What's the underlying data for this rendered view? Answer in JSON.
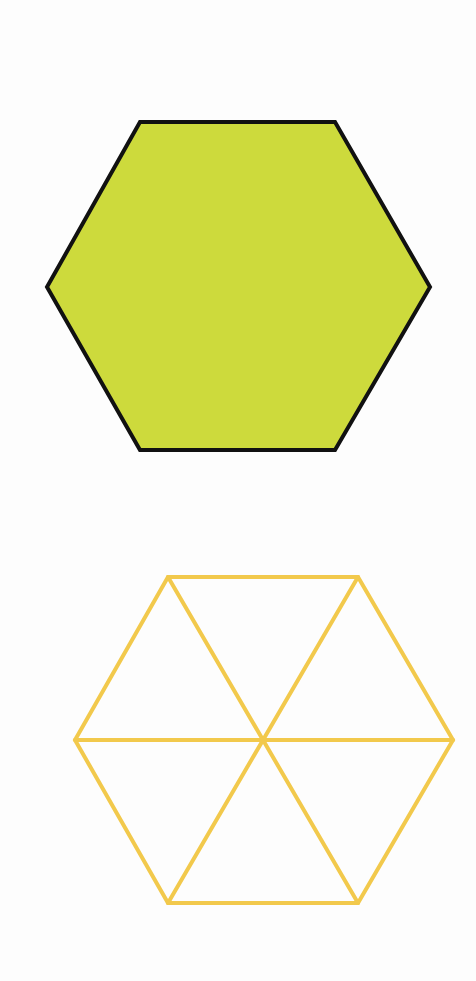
{
  "figures": {
    "filled_hexagon": {
      "points": [
        [
          140,
          122
        ],
        [
          335,
          122
        ],
        [
          430,
          287
        ],
        [
          335,
          450
        ],
        [
          140,
          450
        ],
        [
          47,
          287
        ]
      ],
      "fill": "#CDDA3C",
      "stroke": "#111111",
      "stroke_width": 4
    },
    "divided_hexagon": {
      "points": [
        [
          168,
          577
        ],
        [
          358,
          577
        ],
        [
          453,
          740
        ],
        [
          358,
          903
        ],
        [
          168,
          903
        ],
        [
          75,
          740
        ]
      ],
      "center": [
        262,
        740
      ],
      "fill": "none",
      "stroke": "#F2C94C",
      "stroke_width": 4,
      "triangle_count": 6
    }
  },
  "colors": {
    "background": "#fdfdfd",
    "hexagon_fill": "#CDDA3C",
    "hexagon_outline": "#111111",
    "triangle_lines": "#F2C94C"
  }
}
